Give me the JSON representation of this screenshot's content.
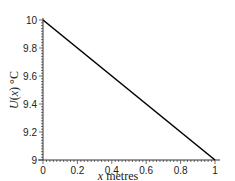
{
  "chart_data": {
    "type": "line",
    "title": "",
    "xlabel": "x metres",
    "ylabel": "U(x) °C",
    "xlim": [
      0,
      1
    ],
    "ylim": [
      9,
      10
    ],
    "grid": false,
    "legend": null,
    "x_ticks": [
      "0",
      "0.2",
      "0.4",
      "0.6",
      "0.8",
      "1"
    ],
    "y_ticks": [
      "9",
      "9.2",
      "9.4",
      "9.6",
      "9.8",
      "10"
    ],
    "series": [
      {
        "name": "U(x)",
        "x": [
          0,
          1
        ],
        "y": [
          10,
          9
        ],
        "color": "#000000"
      }
    ]
  }
}
